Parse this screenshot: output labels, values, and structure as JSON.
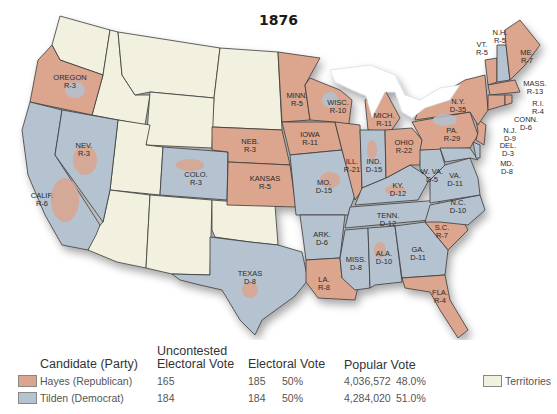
{
  "title": "1876",
  "colors": {
    "republican": "#dba58e",
    "democrat": "#b5c2cf",
    "territory": "#f2f0de",
    "border": "#3a3a3a",
    "water": "#ffffff"
  },
  "states": [
    {
      "name": "OREGON",
      "result": "R-3"
    },
    {
      "name": "CALIF.",
      "result": "R-6"
    },
    {
      "name": "NEV.",
      "result": "R-3"
    },
    {
      "name": "COLO.",
      "result": "R-3"
    },
    {
      "name": "NEB.",
      "result": "R-3"
    },
    {
      "name": "KANSAS",
      "result": "R-5"
    },
    {
      "name": "TEXAS",
      "result": "D-8"
    },
    {
      "name": "MINN.",
      "result": "R-5"
    },
    {
      "name": "IOWA",
      "result": "R-11"
    },
    {
      "name": "MO.",
      "result": "D-15"
    },
    {
      "name": "ARK.",
      "result": "D-6"
    },
    {
      "name": "LA.",
      "result": "R-8"
    },
    {
      "name": "WISC.",
      "result": "R-10"
    },
    {
      "name": "ILL.",
      "result": "R-21"
    },
    {
      "name": "MISS.",
      "result": "D-8"
    },
    {
      "name": "MICH.",
      "result": "R-11"
    },
    {
      "name": "IND.",
      "result": "D-15"
    },
    {
      "name": "KY.",
      "result": "D-12"
    },
    {
      "name": "TENN.",
      "result": "D-12"
    },
    {
      "name": "ALA.",
      "result": "D-10"
    },
    {
      "name": "OHIO",
      "result": "R-22"
    },
    {
      "name": "W. VA.",
      "result": "D-5"
    },
    {
      "name": "GA.",
      "result": "D-11"
    },
    {
      "name": "FLA.",
      "result": "R-4"
    },
    {
      "name": "S.C.",
      "result": "R-7"
    },
    {
      "name": "N.C.",
      "result": "D-10"
    },
    {
      "name": "VA.",
      "result": "D-11"
    },
    {
      "name": "PA.",
      "result": "R-29"
    },
    {
      "name": "N.Y.",
      "result": "D-35"
    },
    {
      "name": "VT.",
      "result": "R-5"
    },
    {
      "name": "N.H.",
      "result": "R-5"
    },
    {
      "name": "ME.",
      "result": "R-7"
    },
    {
      "name": "MASS.",
      "result": "R-13"
    },
    {
      "name": "R.I.",
      "result": "R-4"
    },
    {
      "name": "CONN.",
      "result": "D-6"
    },
    {
      "name": "N.J.",
      "result": "D-9"
    },
    {
      "name": "DEL.",
      "result": "D-3"
    },
    {
      "name": "MD.",
      "result": "D-8"
    }
  ],
  "legend": {
    "headers": {
      "candidate": "Candidate (Party)",
      "uncontested_line1": "Uncontested",
      "uncontested_line2": "Electoral Vote",
      "electoral": "Electoral Vote",
      "popular": "Popular Vote"
    },
    "rows": [
      {
        "candidate": "Hayes (Republican)",
        "uncontested": "165",
        "electoral": "185",
        "electoral_pct": "50%",
        "popular": "4,036,572",
        "popular_pct": "48.0%"
      },
      {
        "candidate": "Tilden (Democrat)",
        "uncontested": "184",
        "electoral": "184",
        "electoral_pct": "50%",
        "popular": "4,284,020",
        "popular_pct": "51.0%"
      }
    ],
    "territories_label": "Territories"
  }
}
